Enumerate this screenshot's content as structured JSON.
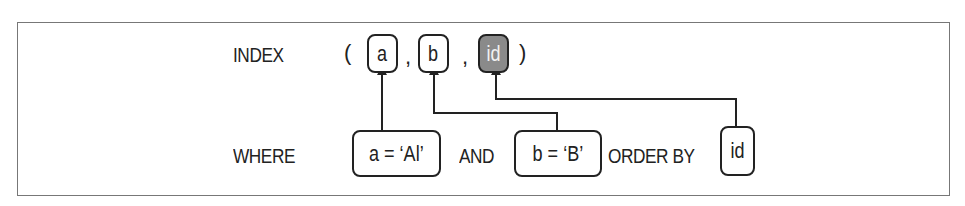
{
  "diagram": {
    "type": "index-usage-diagram",
    "index_row": {
      "keyword": "INDEX",
      "open_paren": "(",
      "close_paren": ")",
      "separator": ",",
      "columns": [
        {
          "label": "a",
          "highlighted": false
        },
        {
          "label": "b",
          "highlighted": false
        },
        {
          "label": "id",
          "highlighted": true
        }
      ]
    },
    "query_row": {
      "where_keyword": "WHERE",
      "conditions": [
        {
          "label": "a = ‘Al’"
        },
        {
          "label": "b = ‘B’"
        }
      ],
      "and_keyword": "AND",
      "order_by_keyword": "ORDER BY",
      "order_by_column": "id"
    },
    "connections": [
      {
        "from": "a = ‘Al’",
        "to": "a"
      },
      {
        "from": "b = ‘B’",
        "to": "b"
      },
      {
        "from": "id",
        "to": "id"
      }
    ],
    "colors": {
      "stroke": "#222222",
      "frame": "#777777",
      "highlight_fill": "#8a8a8a",
      "highlight_text": "#f2f2f2"
    }
  }
}
